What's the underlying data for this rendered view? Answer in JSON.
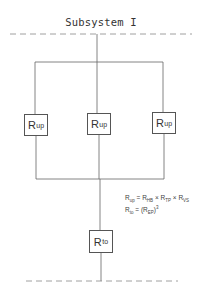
{
  "diagram": {
    "title": "Subsystem I",
    "parallel_blocks": [
      {
        "label": "R",
        "subscript": "up"
      },
      {
        "label": "R",
        "subscript": "up"
      },
      {
        "label": "R",
        "subscript": "up"
      }
    ],
    "series_block": {
      "label": "R",
      "subscript": "to"
    },
    "formulas": [
      {
        "lhs": "R",
        "lhs_sub": "up",
        "rhs": "= R",
        "t1_sub": "HB",
        "t2": "× R",
        "t2_sub": "TP",
        "t3": "× R",
        "t3_sub": "VS"
      },
      {
        "lhs": "R",
        "lhs_sub": "to",
        "rhs": "= (R",
        "t1_sub": "EP",
        "close": ")",
        "exp": "3"
      }
    ],
    "colors": {
      "line": "#666666",
      "dashed": "#888888",
      "text": "#333333"
    }
  }
}
